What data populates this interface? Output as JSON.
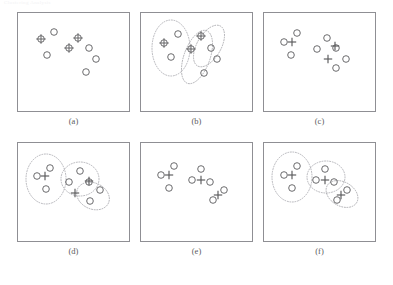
{
  "header": {
    "text": "Clustering Analysis"
  },
  "figure": {
    "title": "",
    "panel_width": 113,
    "panel_height": 100,
    "colors": {
      "border": "#8f8f94",
      "marker": "#5a5a5c",
      "ellipse": "#9a9aa0",
      "background": "#ffffff"
    }
  },
  "chart_data": {
    "type": "scatter",
    "title": "",
    "xlabel": "",
    "ylabel": "",
    "xlim": [
      0,
      113
    ],
    "ylim": [
      0,
      100
    ],
    "grid": false,
    "legend": "none",
    "marker_legend": [
      {
        "symbol": "circle",
        "meaning": "data point"
      },
      {
        "symbol": "crossed-circle",
        "meaning": "data point selected as seed/centroid"
      },
      {
        "symbol": "plus",
        "meaning": "computed cluster centroid"
      },
      {
        "symbol": "dotted-ellipse",
        "meaning": "cluster boundary"
      }
    ],
    "panels": [
      {
        "label": "(a)",
        "points": [
          {
            "x": 24,
            "y": 27,
            "type": "crossed-circle"
          },
          {
            "x": 37,
            "y": 20,
            "type": "circle"
          },
          {
            "x": 30,
            "y": 43,
            "type": "circle"
          },
          {
            "x": 61,
            "y": 26,
            "type": "crossed-circle"
          },
          {
            "x": 52,
            "y": 36,
            "type": "crossed-circle"
          },
          {
            "x": 72,
            "y": 36,
            "type": "circle"
          },
          {
            "x": 79,
            "y": 47,
            "type": "circle"
          },
          {
            "x": 69,
            "y": 60,
            "type": "circle"
          }
        ],
        "centroids": [],
        "ellipses": []
      },
      {
        "label": "(b)",
        "points": [
          {
            "x": 24,
            "y": 31,
            "type": "crossed-circle"
          },
          {
            "x": 38,
            "y": 22,
            "type": "circle"
          },
          {
            "x": 31,
            "y": 45,
            "type": "circle"
          },
          {
            "x": 61,
            "y": 24,
            "type": "crossed-circle"
          },
          {
            "x": 51,
            "y": 37,
            "type": "crossed-circle"
          },
          {
            "x": 71,
            "y": 36,
            "type": "circle"
          },
          {
            "x": 77,
            "y": 47,
            "type": "circle"
          },
          {
            "x": 64,
            "y": 61,
            "type": "circle"
          }
        ],
        "centroids": [],
        "ellipses": [
          {
            "cx": 31,
            "cy": 36,
            "rx": 19,
            "ry": 28,
            "rotation": 0
          },
          {
            "cx": 57,
            "cy": 45,
            "rx": 13,
            "ry": 28,
            "rotation": 20
          },
          {
            "cx": 69,
            "cy": 34,
            "rx": 12,
            "ry": 23,
            "rotation": 30
          }
        ]
      },
      {
        "label": "(c)",
        "points": [
          {
            "x": 21,
            "y": 30,
            "type": "circle"
          },
          {
            "x": 34,
            "y": 21,
            "type": "circle"
          },
          {
            "x": 28,
            "y": 43,
            "type": "circle"
          },
          {
            "x": 64,
            "y": 26,
            "type": "circle"
          },
          {
            "x": 54,
            "y": 37,
            "type": "circle"
          },
          {
            "x": 73,
            "y": 36,
            "type": "circle"
          },
          {
            "x": 83,
            "y": 47,
            "type": "circle"
          },
          {
            "x": 73,
            "y": 56,
            "type": "circle"
          }
        ],
        "centroids": [
          {
            "x": 29,
            "y": 30
          },
          {
            "x": 72,
            "y": 34
          },
          {
            "x": 65,
            "y": 47
          }
        ],
        "ellipses": []
      },
      {
        "label": "(d)",
        "points": [
          {
            "x": 20,
            "y": 34,
            "type": "circle"
          },
          {
            "x": 33,
            "y": 26,
            "type": "circle"
          },
          {
            "x": 29,
            "y": 47,
            "type": "circle"
          },
          {
            "x": 63,
            "y": 29,
            "type": "circle"
          },
          {
            "x": 52,
            "y": 40,
            "type": "circle"
          },
          {
            "x": 72,
            "y": 40,
            "type": "circle"
          },
          {
            "x": 83,
            "y": 48,
            "type": "circle"
          },
          {
            "x": 73,
            "y": 59,
            "type": "circle"
          }
        ],
        "centroids": [
          {
            "x": 28,
            "y": 34
          },
          {
            "x": 72,
            "y": 39
          },
          {
            "x": 58,
            "y": 51
          }
        ],
        "ellipses": [
          {
            "cx": 29,
            "cy": 37,
            "rx": 20,
            "ry": 25,
            "rotation": 0
          },
          {
            "cx": 63,
            "cy": 37,
            "rx": 19,
            "ry": 17,
            "rotation": 0
          },
          {
            "cx": 76,
            "cy": 54,
            "rx": 17,
            "ry": 13,
            "rotation": 25
          }
        ]
      },
      {
        "label": "(e)",
        "points": [
          {
            "x": 21,
            "y": 33,
            "type": "circle"
          },
          {
            "x": 34,
            "y": 24,
            "type": "circle"
          },
          {
            "x": 29,
            "y": 46,
            "type": "circle"
          },
          {
            "x": 61,
            "y": 27,
            "type": "circle"
          },
          {
            "x": 52,
            "y": 38,
            "type": "circle"
          },
          {
            "x": 70,
            "y": 40,
            "type": "circle"
          },
          {
            "x": 84,
            "y": 48,
            "type": "circle"
          },
          {
            "x": 73,
            "y": 58,
            "type": "circle"
          }
        ],
        "centroids": [
          {
            "x": 29,
            "y": 33
          },
          {
            "x": 61,
            "y": 38
          },
          {
            "x": 78,
            "y": 53
          }
        ],
        "ellipses": []
      },
      {
        "label": "(f)",
        "points": [
          {
            "x": 21,
            "y": 33,
            "type": "circle"
          },
          {
            "x": 34,
            "y": 24,
            "type": "circle"
          },
          {
            "x": 29,
            "y": 46,
            "type": "circle"
          },
          {
            "x": 62,
            "y": 27,
            "type": "circle"
          },
          {
            "x": 53,
            "y": 38,
            "type": "circle"
          },
          {
            "x": 71,
            "y": 40,
            "type": "circle"
          },
          {
            "x": 84,
            "y": 48,
            "type": "circle"
          },
          {
            "x": 74,
            "y": 58,
            "type": "circle"
          }
        ],
        "centroids": [
          {
            "x": 29,
            "y": 33
          },
          {
            "x": 62,
            "y": 38
          },
          {
            "x": 78,
            "y": 53
          }
        ],
        "ellipses": [
          {
            "cx": 29,
            "cy": 35,
            "rx": 20,
            "ry": 25,
            "rotation": 0
          },
          {
            "cx": 63,
            "cy": 35,
            "rx": 19,
            "ry": 16,
            "rotation": 0
          },
          {
            "cx": 79,
            "cy": 52,
            "rx": 17,
            "ry": 12,
            "rotation": 30
          }
        ]
      }
    ]
  }
}
